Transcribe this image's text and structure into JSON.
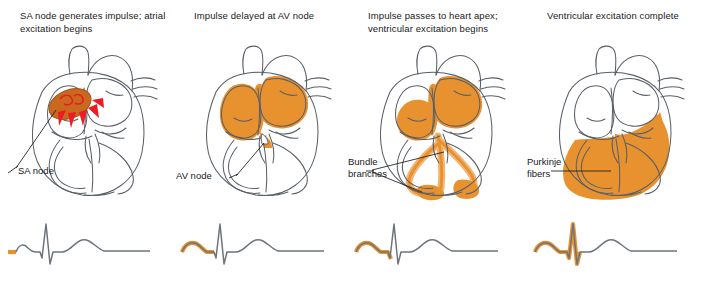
{
  "figure": {
    "colors": {
      "excited_fill": "#E8922F",
      "excited_fill_light": "#F3B573",
      "sa_node_fill": "#C8691E",
      "arrow_red": "#ED1C24",
      "outline": "#5A6068",
      "ecg_line": "#6E747B",
      "ecg_highlight": "#E8922F",
      "text": "#1a1a1a",
      "background": "#ffffff"
    }
  },
  "panels": [
    {
      "index": "1",
      "caption": "SA node generates impulse; atrial excitation begins",
      "label": "SA node",
      "heart_state": "sa-node-firing",
      "ecg": {
        "highlight_segment": "p-wave-onset",
        "waves": [
          "P",
          "QRS",
          "T"
        ]
      }
    },
    {
      "index": "2",
      "caption": "Impulse delayed at AV node",
      "label": "AV node",
      "heart_state": "atria-excited",
      "ecg": {
        "highlight_segment": "p-wave-complete",
        "waves": [
          "P",
          "QRS",
          "T"
        ]
      }
    },
    {
      "index": "3",
      "caption": "Impulse passes to heart apex; ventricular excitation begins",
      "label": "Bundle branches",
      "label_line1": "Bundle",
      "label_line2": "branches",
      "heart_state": "bundle-branches-apex",
      "ecg": {
        "highlight_segment": "p-wave-and-pr-segment",
        "waves": [
          "P",
          "QRS",
          "T"
        ]
      }
    },
    {
      "index": "4",
      "caption": "Ventricular excitation complete",
      "label": "Purkinje fibers",
      "label_line1": "Purkinje",
      "label_line2": "fibers",
      "heart_state": "ventricles-excited",
      "ecg": {
        "highlight_segment": "p-wave-through-qrs",
        "waves": [
          "P",
          "QRS",
          "T"
        ]
      }
    }
  ]
}
